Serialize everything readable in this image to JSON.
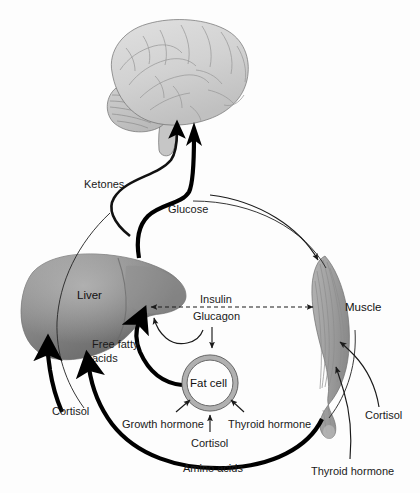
{
  "figure": {
    "background_color": "#fdfdfd",
    "line_color": "#000000",
    "organ_fill_light": "#d0d0d0",
    "organ_fill_mid": "#9a9a9a",
    "organ_fill_dark": "#6e6e6e"
  },
  "organs": [
    {
      "id": "brain",
      "label": "Brain",
      "label_visible": false
    },
    {
      "id": "liver",
      "label": "Liver",
      "label_visible": true
    },
    {
      "id": "muscle",
      "label": "Muscle",
      "label_visible": true
    },
    {
      "id": "fat_cell",
      "label": "Fat cell",
      "label_visible": true
    }
  ],
  "labels": {
    "ketones": "Ketones",
    "glucose": "Glucose",
    "liver": "Liver",
    "muscle": "Muscle",
    "insulin": "Insulin",
    "glucagon": "Glucagon",
    "free_fatty_acids_line1": "Free fatty",
    "free_fatty_acids_line2": "acids",
    "fat_cell": "Fat cell",
    "cortisol_liver": "Cortisol",
    "growth_hormone": "Growth hormone",
    "thyroid_hormone_fat": "Thyroid hormone",
    "cortisol_fat": "Cortisol",
    "cortisol_muscle": "Cortisol",
    "thyroid_hormone_muscle": "Thyroid hormone",
    "amino_acids": "Amino acids"
  },
  "flows": [
    {
      "id": "ketones-to-brain",
      "label": "Ketones",
      "from": "liver",
      "to": "brain",
      "weight": "medium",
      "style": "solid"
    },
    {
      "id": "glucose-to-brain",
      "label": "Glucose",
      "from": "liver",
      "to": "brain",
      "weight": "thick",
      "style": "solid"
    },
    {
      "id": "glucose-to-muscle",
      "label": "Glucose",
      "from": "liver",
      "to": "muscle",
      "weight": "thin",
      "style": "solid"
    },
    {
      "id": "insulin-glucagon",
      "label": "Insulin / Glucagon",
      "from": "liver",
      "to": "muscle",
      "weight": "thin",
      "style": "dashed",
      "bidirectional": true
    },
    {
      "id": "glucagon-to-liver",
      "label": "Glucagon",
      "from": "glucagon",
      "to": "liver",
      "weight": "thin",
      "style": "solid"
    },
    {
      "id": "glucagon-to-fat",
      "label": "Glucagon",
      "from": "glucagon",
      "to": "fat_cell",
      "weight": "thin",
      "style": "solid"
    },
    {
      "id": "ffa-to-liver",
      "label": "Free fatty acids",
      "from": "fat_cell",
      "to": "liver",
      "weight": "thick",
      "style": "solid"
    },
    {
      "id": "cortisol-to-liver",
      "label": "Cortisol",
      "from": "cortisol",
      "to": "liver",
      "weight": "thick",
      "style": "solid"
    },
    {
      "id": "amino-acids-to-liver",
      "label": "Amino acids",
      "from": "muscle",
      "to": "liver",
      "weight": "thick",
      "style": "solid"
    },
    {
      "id": "growth-hormone-to-fat",
      "label": "Growth hormone",
      "from": "growth_hormone",
      "to": "fat_cell",
      "weight": "thin",
      "style": "solid"
    },
    {
      "id": "thyroid-hormone-to-fat",
      "label": "Thyroid hormone",
      "from": "thyroid_hormone",
      "to": "fat_cell",
      "weight": "thin",
      "style": "solid"
    },
    {
      "id": "cortisol-to-fat",
      "label": "Cortisol",
      "from": "cortisol",
      "to": "fat_cell",
      "weight": "thin",
      "style": "solid"
    },
    {
      "id": "cortisol-to-muscle",
      "label": "Cortisol",
      "from": "cortisol",
      "to": "muscle",
      "weight": "thin",
      "style": "solid"
    },
    {
      "id": "thyroid-hormone-to-muscle",
      "label": "Thyroid hormone",
      "from": "thyroid_hormone",
      "to": "muscle",
      "weight": "thin",
      "style": "solid"
    }
  ]
}
